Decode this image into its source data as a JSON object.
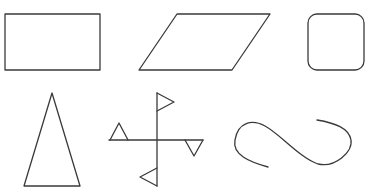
{
  "diagram": {
    "title": "",
    "stroke_color": "#3a3a3a",
    "background": "#ffffff",
    "shapes": [
      {
        "id": "rectangle",
        "label": "rectangle"
      },
      {
        "id": "parallelogram",
        "label": "parallelogram"
      },
      {
        "id": "rounded-square",
        "label": "rounded square"
      },
      {
        "id": "isosceles-triangle",
        "label": "isosceles triangle"
      },
      {
        "id": "pinwheel-cross",
        "label": "cross with four triangular flags"
      },
      {
        "id": "s-curve",
        "label": "open S-shaped curve"
      }
    ]
  }
}
